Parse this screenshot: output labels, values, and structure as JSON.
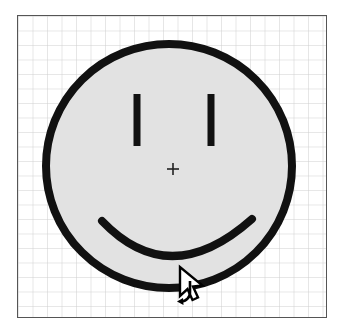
{
  "app": {
    "title": "Drawing Canvas",
    "window_width": 346,
    "window_height": 333
  },
  "canvas": {
    "name": "drawing-canvas",
    "x": 17,
    "y": 15,
    "width": 310,
    "height": 303,
    "background_color": "#ffffff",
    "border_color": "#555555",
    "border_width": 1
  },
  "grid": {
    "visible": true,
    "cell_size": 14.5,
    "line_color": "#cfcfcf",
    "line_width": 1,
    "columns": 21,
    "rows": 21
  },
  "shapes": {
    "face": {
      "type": "ellipse",
      "label": "smiley-face-outline",
      "cx": 151,
      "cy": 150,
      "rx": 123,
      "ry": 122,
      "fill_color": "#e2e2e2",
      "stroke_color": "#111111",
      "stroke_width": 8,
      "selected": true
    },
    "eye_left": {
      "type": "line",
      "label": "left-eye",
      "x": 119,
      "y1": 78,
      "y2": 130,
      "stroke_color": "#111111",
      "stroke_width": 7
    },
    "eye_right": {
      "type": "line",
      "label": "right-eye",
      "x": 193,
      "y1": 78,
      "y2": 130,
      "stroke_color": "#111111",
      "stroke_width": 7
    },
    "mouth": {
      "type": "arc",
      "label": "smile-arc",
      "start_x": 84,
      "start_y": 205,
      "control_x": 151,
      "control_y": 268,
      "end_x": 234,
      "end_y": 203,
      "stroke_color": "#111111",
      "stroke_width": 8
    },
    "center_marker": {
      "type": "crosshair",
      "label": "rotation-center-marker",
      "cx": 155,
      "cy": 153,
      "size": 11,
      "stroke_color": "#222222",
      "stroke_width": 1.6
    }
  },
  "cursor": {
    "name": "rotate-cursor",
    "tip_x": 180,
    "tip_y": 267,
    "arrow_fill": "#ffffff",
    "arrow_stroke": "#000000",
    "rotate_hint_color": "#000000",
    "mode_label": "rotate"
  },
  "colors": {
    "stroke": "#111111",
    "shape_fill": "#e2e2e2",
    "grid_line": "#cfcfcf",
    "canvas_border": "#555555",
    "page_background": "#ffffff"
  }
}
